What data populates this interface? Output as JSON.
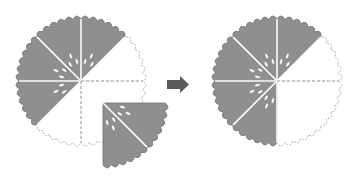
{
  "diagram": {
    "type": "pie-slice-removal-illustration",
    "colors": {
      "filled": "#8f8f8f",
      "outline": "#6f6f6f",
      "empty": "#ffffff",
      "dashed": "#999999",
      "seed": "#ffffff",
      "arrow": "#5a5a5a"
    },
    "left_pie": {
      "total_slices": 8,
      "filled_slices": 5,
      "empty_slices": 2,
      "detached_slices": 1,
      "detached_slice_width": 2
    },
    "arrow": {
      "direction": "right"
    },
    "right_pie": {
      "total_slices": 8,
      "filled_slices": 5,
      "empty_slices": 3
    }
  }
}
